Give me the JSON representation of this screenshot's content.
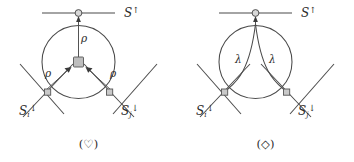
{
  "figure": {
    "width": 354,
    "height": 162,
    "background": "#ffffff",
    "line_color": "#4a4a4a",
    "node_fill": "#bdbdbd",
    "text_color": "#2b2b2b"
  },
  "panels": [
    {
      "id": "heart",
      "caption": "(♡)",
      "caption_symbol_name": "heart-symbol",
      "top_label": "S",
      "top_label_sup": "↑",
      "left_label": "S",
      "left_label_sub": "i",
      "left_label_sup": "↓",
      "right_label": "S",
      "right_label_sub": "j",
      "right_label_sup": "↓",
      "edge_labels": [
        "ρ",
        "ρ",
        "ρ"
      ],
      "edge_label_top": "ρ",
      "edge_label_left": "ρ",
      "edge_label_right": "ρ",
      "center_node_shape": "square",
      "top_node_shape": "circle"
    },
    {
      "id": "diamond",
      "caption": "(◇)",
      "caption_symbol_name": "diamond-symbol",
      "top_label": "S",
      "top_label_sup": "↑",
      "left_label": "S",
      "left_label_sub": "i",
      "left_label_sup": "↓",
      "right_label": "S",
      "right_label_sub": "j",
      "right_label_sup": "↓",
      "edge_labels": [
        "λ",
        "λ"
      ],
      "edge_label_left": "λ",
      "edge_label_right": "λ",
      "center_node_shape": "none",
      "top_node_shape": "circle"
    }
  ]
}
